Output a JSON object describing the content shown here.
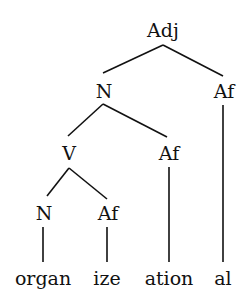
{
  "diagram": {
    "type": "morphological-tree",
    "nodes": {
      "root": {
        "label": "Adj"
      },
      "n1": {
        "label": "N"
      },
      "af1": {
        "label": "Af"
      },
      "v": {
        "label": "V"
      },
      "af2": {
        "label": "Af"
      },
      "n2": {
        "label": "N"
      },
      "af3": {
        "label": "Af"
      }
    },
    "leaves": {
      "organ": {
        "label": "organ"
      },
      "ize": {
        "label": "ize"
      },
      "ation": {
        "label": "ation"
      },
      "al": {
        "label": "al"
      }
    },
    "structure": "[Adj [N [V [N organ] [Af ize]] [Af ation]] [Af al]]"
  }
}
